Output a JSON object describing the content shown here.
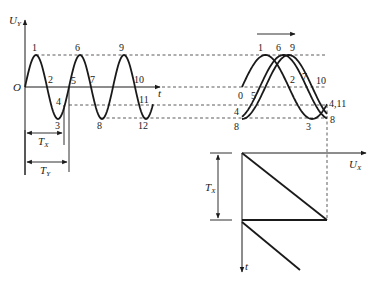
{
  "diagram": {
    "left_panel": {
      "y_axis_label": {
        "main": "U",
        "sub": "Y"
      },
      "x_axis_label": "t",
      "origin_label": "O",
      "point_labels": [
        "1",
        "2",
        "3",
        "4",
        "5",
        "6",
        "7",
        "8",
        "9",
        "10",
        "11",
        "12"
      ],
      "period_x_label": {
        "main": "T",
        "sub": "X"
      },
      "period_y_label": {
        "main": "T",
        "sub": "Y"
      }
    },
    "right_panel": {
      "top_labels": [
        "1",
        "6",
        "9"
      ],
      "trace_labels": [
        "0",
        "5",
        "4",
        "8",
        "2",
        "7",
        "10",
        "3"
      ],
      "right_labels": [
        "4,11",
        "8"
      ],
      "direction_arrow": "right",
      "sweep_axis_label": {
        "main": "U",
        "sub": "X"
      },
      "sweep_time_label": "t",
      "sweep_period_label": {
        "main": "T",
        "sub": "X"
      }
    }
  }
}
